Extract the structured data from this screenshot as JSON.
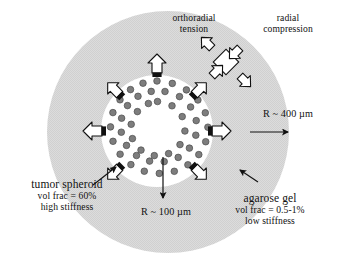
{
  "figure": {
    "type": "schematic-diagram",
    "background_color": "#ffffff"
  },
  "regions": {
    "gel": {
      "name": "agarose gel",
      "fill_color": "#d9d9d9",
      "texture": "fine checkerboard stipple",
      "center": {
        "x": 168,
        "y": 132
      },
      "radius": 121
    },
    "spheroid": {
      "name": "tumor spheroid",
      "fill_color": "#ffffff",
      "center": {
        "x": 157,
        "y": 131
      },
      "radius": 56,
      "cell_color": "#7d7d7d",
      "cell_stroke": "#4a4a4a",
      "cell_radius": 3.3,
      "core": {
        "radius": 26,
        "fill_color": "#ffffff"
      }
    }
  },
  "labels": {
    "orthoradial_tension": {
      "line1": "orthoradial",
      "line2": "tension"
    },
    "radial_compression": {
      "line1": "radial",
      "line2": "compression"
    },
    "outer_radius": "R ~ 400 µm",
    "inner_radius": "R ~ 100 µm",
    "tumor_spheroid": {
      "title": "tumor spheroid",
      "vol_frac": "vol frac = 60%",
      "stiffness": "high stiffness"
    },
    "agarose_gel": {
      "title": "agarose gel",
      "vol_frac": "vol frac = 0.5-1%",
      "stiffness": "low stiffness"
    }
  },
  "annotations": {
    "stress_arrows": {
      "style": "hollow outline block arrows with black bar at tail",
      "description": "arrows point outward from the spheroid boundary into the gel",
      "count": 8
    },
    "stress_element": {
      "style": "rotated square element with four hollow arrows",
      "outward_pair": "orthoradial tension",
      "inward_pair": "radial compression"
    },
    "dimension_arrows": {
      "outer": "horizontal arrow pointing right, from gel center region to gel edge",
      "inner": "vertical arrow pointing down, from spheroid center to spheroid edge"
    },
    "leader_lines": {
      "tumor_spheroid": "thin black arrow from label to spheroid boundary",
      "agarose_gel": "thin black arrow from label to gel interior"
    }
  },
  "colors": {
    "gel_fill": "#d9d9d9",
    "spheroid_fill": "#ffffff",
    "cell_fill": "#7d7d7d",
    "cell_stroke": "#4a4a4a",
    "ink": "#111111",
    "arrow_fill": "#ffffff",
    "arrow_stroke": "#111111"
  }
}
